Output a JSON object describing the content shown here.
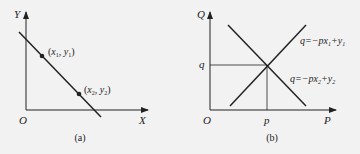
{
  "panel_a": {
    "caption": "(a)",
    "y_axis_label": "Y",
    "x_axis_label": "X",
    "origin_label": "O",
    "point1": {
      "label_x": "x",
      "sub1": "1",
      "label_y": "y",
      "sub2": "1"
    },
    "point2": {
      "label_x": "x",
      "sub1": "2",
      "label_y": "y",
      "sub2": "2"
    }
  },
  "panel_b": {
    "caption": "(b)",
    "y_axis_label": "Q",
    "x_axis_label": "P",
    "origin_label": "O",
    "q_tick_label": "q",
    "p_tick_label": "p",
    "line1": {
      "lhs": "q=−px",
      "sub_x": "1",
      "plus": "+y",
      "sub_y": "1"
    },
    "line2": {
      "lhs": "q=−px",
      "sub_x": "2",
      "plus": "+y",
      "sub_y": "2"
    }
  },
  "colors": {
    "line": "#222222",
    "background": "#f2f2f2"
  }
}
